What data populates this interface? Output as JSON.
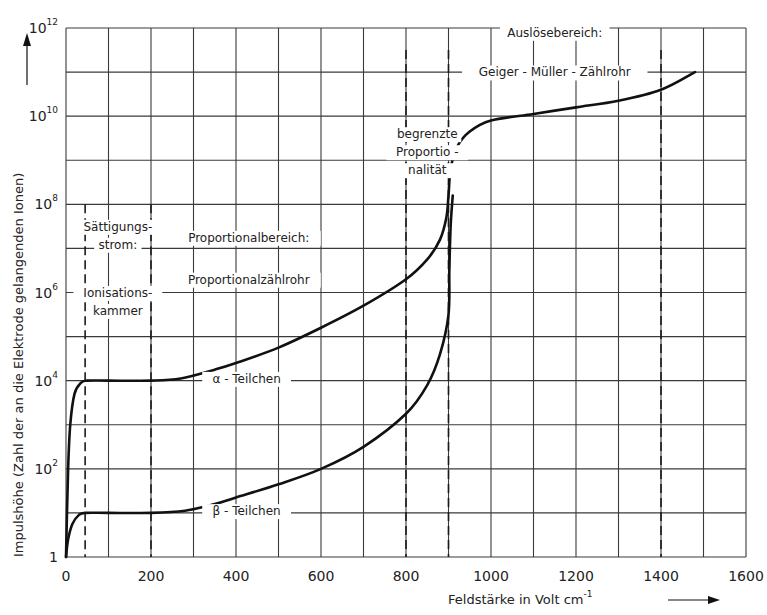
{
  "chart_data": {
    "type": "line",
    "title": "",
    "xlabel": "Feldstärke in Volt cm⁻¹",
    "ylabel": "Impulshöhe (Zahl der an die Elektrode gelangenden Ionen)",
    "xlim": [
      0,
      1600
    ],
    "ylim_log10": [
      0,
      12
    ],
    "yscale": "log",
    "grid": true,
    "x_ticks": [
      0,
      200,
      400,
      600,
      800,
      1000,
      1200,
      1400,
      1600
    ],
    "x_grid_step": 100,
    "y_ticks": [
      {
        "exp": 0,
        "label": "1"
      },
      {
        "exp": 2,
        "label": "10",
        "sup": "2"
      },
      {
        "exp": 4,
        "label": "10",
        "sup": "4"
      },
      {
        "exp": 6,
        "label": "10",
        "sup": "6"
      },
      {
        "exp": 8,
        "label": "10",
        "sup": "8"
      },
      {
        "exp": 10,
        "label": "10",
        "sup": "10"
      },
      {
        "exp": 12,
        "label": "10",
        "sup": "12"
      }
    ],
    "region_boundaries": [
      {
        "x": 45,
        "y_top_exp": 8.0
      },
      {
        "x": 200,
        "y_top_exp": 8.0
      },
      {
        "x": 800,
        "y_top_exp": 11.5
      },
      {
        "x": 900,
        "y_top_exp": 11.5
      },
      {
        "x": 1400,
        "y_top_exp": 11.5
      }
    ],
    "series": [
      {
        "name": "α - Teilchen",
        "points_log10": [
          [
            0,
            0
          ],
          [
            5,
            2.0
          ],
          [
            10,
            3.0
          ],
          [
            20,
            3.7
          ],
          [
            35,
            3.95
          ],
          [
            50,
            4.0
          ],
          [
            100,
            4.0
          ],
          [
            200,
            4.0
          ],
          [
            270,
            4.05
          ],
          [
            350,
            4.25
          ],
          [
            400,
            4.4
          ],
          [
            500,
            4.75
          ],
          [
            600,
            5.2
          ],
          [
            700,
            5.7
          ],
          [
            800,
            6.3
          ],
          [
            850,
            6.75
          ],
          [
            880,
            7.2
          ],
          [
            895,
            7.7
          ],
          [
            900,
            8.2
          ],
          [
            905,
            8.8
          ],
          [
            920,
            9.3
          ],
          [
            950,
            9.65
          ],
          [
            1000,
            9.9
          ],
          [
            1100,
            10.05
          ],
          [
            1200,
            10.2
          ],
          [
            1300,
            10.35
          ],
          [
            1400,
            10.6
          ],
          [
            1480,
            11.0
          ]
        ]
      },
      {
        "name": "β - Teilchen",
        "points_log10": [
          [
            0,
            0
          ],
          [
            5,
            0.4
          ],
          [
            15,
            0.75
          ],
          [
            30,
            0.95
          ],
          [
            45,
            1.0
          ],
          [
            100,
            1.0
          ],
          [
            200,
            1.0
          ],
          [
            280,
            1.05
          ],
          [
            350,
            1.2
          ],
          [
            400,
            1.35
          ],
          [
            500,
            1.65
          ],
          [
            600,
            2.0
          ],
          [
            700,
            2.5
          ],
          [
            800,
            3.25
          ],
          [
            850,
            3.9
          ],
          [
            880,
            4.6
          ],
          [
            900,
            5.5
          ],
          [
            902,
            6.5
          ],
          [
            905,
            7.5
          ],
          [
            910,
            8.2
          ]
        ]
      }
    ],
    "annotations": [
      {
        "id": "saettigung",
        "lines": [
          "Sättigungs-",
          "strom:"
        ],
        "x": 122,
        "y_exp": 7.4
      },
      {
        "id": "ionisation",
        "lines": [
          "Ionisations-",
          "kammer"
        ],
        "x": 122,
        "y_exp": 5.9
      },
      {
        "id": "proportionalbereich",
        "lines": [
          "Proportionalbereich:"
        ],
        "x": 430,
        "y_exp": 7.15
      },
      {
        "id": "proportionalzaehlrohr",
        "lines": [
          "Proportionalzählrohr"
        ],
        "x": 430,
        "y_exp": 6.2
      },
      {
        "id": "begrenzte",
        "lines": [
          "begrenzte",
          "Proportio -",
          "nalität"
        ],
        "x": 850,
        "y_exp": 9.5
      },
      {
        "id": "ausloesebereich",
        "lines": [
          "Auslösebereich:"
        ],
        "x": 1150,
        "y_exp": 11.8
      },
      {
        "id": "geiger",
        "lines": [
          "Geiger - Müller - Zählrohr"
        ],
        "x": 1150,
        "y_exp": 10.9
      },
      {
        "id": "alpha-label",
        "lines": [
          "α - Teilchen"
        ],
        "x": 425,
        "y_exp": 3.95
      },
      {
        "id": "beta-label",
        "lines": [
          "β - Teilchen"
        ],
        "x": 425,
        "y_exp": 0.95
      }
    ],
    "x_axis_arrow": "→",
    "y_axis_arrow": "↑"
  },
  "texts": {
    "xlabel_main": "Feldstärke  in  Volt  cm",
    "xlabel_sup": "-1",
    "ylabel": "Impulshöhe  (Zahl der an die Elektrode gelangenden  Ionen)"
  }
}
